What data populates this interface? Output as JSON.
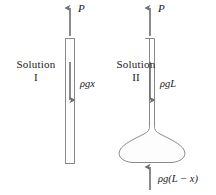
{
  "figure": {
    "background_color": "#ffffff",
    "stroke_color": "#7a7a7a",
    "text_color": "#1a1a1a",
    "solution_1": {
      "caption_line_1": "Solution",
      "caption_line_2": "I",
      "force_up_label": "P",
      "force_down_label": "ρgx",
      "vessel_type": "straight-tube"
    },
    "solution_2": {
      "caption_line_1": "Solution",
      "caption_line_2": "II",
      "force_up_top_label": "P",
      "force_down_label": "ρgL",
      "force_up_bottom_label": "ρg(L − x)",
      "vessel_type": "tube-with-flared-bulb"
    }
  }
}
